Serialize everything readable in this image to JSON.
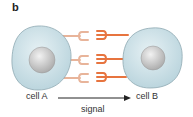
{
  "panel": {
    "label": "b"
  },
  "cells": [
    {
      "name": "cell A",
      "label": "cell A"
    },
    {
      "name": "cell B",
      "label": "cell B"
    }
  ],
  "arrow": {
    "label": "signal",
    "direction": "cell A to cell B"
  },
  "colors": {
    "cytoplasm": "#cfe3ea",
    "cell_outline": "#8fa9b3",
    "nucleus": "#c9c9c9",
    "receptor_pale": "#e8b49a",
    "ligand_orange": "#e7743f",
    "arrow": "#222222"
  },
  "icons": {
    "cellA": "cell-icon",
    "cellB": "cell-icon",
    "receptors": "cup-receptor-icon",
    "ligands": "fork-ligand-icon"
  }
}
